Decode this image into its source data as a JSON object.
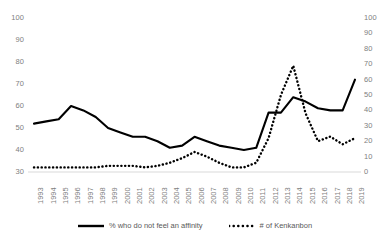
{
  "chart_data": {
    "type": "line",
    "title": "",
    "xlabel": "",
    "ylabel": "",
    "grid": false,
    "legend_position": "bottom",
    "x": [
      "1993",
      "1994",
      "1995",
      "1996",
      "1997",
      "1998",
      "1999",
      "2000",
      "2001",
      "2002",
      "2003",
      "2004",
      "2005",
      "2006",
      "2007",
      "2008",
      "2009",
      "2010",
      "2011",
      "2012",
      "2013",
      "2014",
      "2015",
      "2016",
      "2017",
      "2018",
      "2019"
    ],
    "axes": {
      "left": {
        "ticks": [
          30,
          40,
          50,
          60,
          70,
          80,
          90,
          100
        ],
        "ylim": [
          30,
          100
        ],
        "label": "",
        "applies_to": "% who do not feel an affinity"
      },
      "right": {
        "ticks": [
          0,
          10,
          20,
          30,
          40,
          50,
          60,
          70,
          80,
          90,
          100
        ],
        "ylim": [
          0,
          100
        ],
        "label": "",
        "applies_to": "# of Kenkanbon"
      }
    },
    "series": [
      {
        "name": "% who do not feel an affinity",
        "axis": "left",
        "style": "solid",
        "color": "#000000",
        "values": [
          52,
          53,
          54,
          60,
          58,
          55,
          50,
          48,
          46,
          46,
          44,
          41,
          42,
          46,
          44,
          42,
          41,
          40,
          41,
          57,
          57,
          64,
          62,
          59,
          58,
          58,
          72
        ]
      },
      {
        "name": "# of Kenkanbon",
        "axis": "right",
        "style": "dotted",
        "color": "#000000",
        "values": [
          3,
          3,
          3,
          3,
          3,
          3,
          4,
          4,
          4,
          3,
          4,
          6,
          9,
          13,
          10,
          6,
          3,
          3,
          6,
          22,
          50,
          69,
          38,
          20,
          23,
          18,
          22
        ]
      }
    ]
  },
  "legend": {
    "items": [
      {
        "label": "% who do not feel an affinity",
        "style": "solid"
      },
      {
        "label": "# of Kenkanbon",
        "style": "dotted"
      }
    ]
  }
}
